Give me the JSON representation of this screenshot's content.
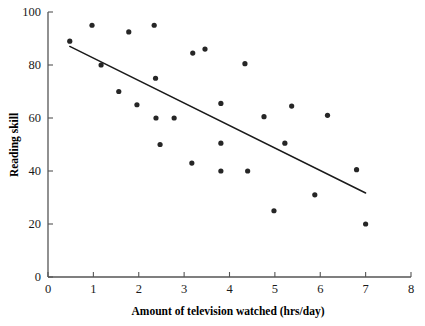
{
  "chart_data": {
    "type": "scatter",
    "title": "",
    "xlabel": "Amount of television watched (hrs/day)",
    "ylabel": "Reading skill",
    "xlim": [
      0,
      8
    ],
    "ylim": [
      0,
      100
    ],
    "xticks": [
      0,
      1,
      2,
      3,
      4,
      5,
      6,
      7,
      8
    ],
    "yticks": [
      0,
      20,
      40,
      60,
      80,
      100
    ],
    "xtick_labels": [
      "0",
      "1",
      "2",
      "3",
      "4",
      "5",
      "6",
      "7",
      "8"
    ],
    "ytick_labels": [
      "0",
      "20",
      "40",
      "60",
      "80",
      "100"
    ],
    "grid": false,
    "legend": null,
    "point_color": "#262626",
    "line_color": "#1a1a1a",
    "points": [
      {
        "x": 0.48,
        "y": 89
      },
      {
        "x": 0.97,
        "y": 95
      },
      {
        "x": 1.17,
        "y": 80
      },
      {
        "x": 1.56,
        "y": 70
      },
      {
        "x": 1.78,
        "y": 92.5
      },
      {
        "x": 1.96,
        "y": 65
      },
      {
        "x": 2.34,
        "y": 95
      },
      {
        "x": 2.37,
        "y": 75
      },
      {
        "x": 2.38,
        "y": 60
      },
      {
        "x": 2.47,
        "y": 50
      },
      {
        "x": 2.78,
        "y": 60
      },
      {
        "x": 3.17,
        "y": 43
      },
      {
        "x": 3.19,
        "y": 84.5
      },
      {
        "x": 3.46,
        "y": 86
      },
      {
        "x": 3.81,
        "y": 65.5
      },
      {
        "x": 3.81,
        "y": 50.5
      },
      {
        "x": 3.81,
        "y": 40
      },
      {
        "x": 4.34,
        "y": 80.5
      },
      {
        "x": 4.4,
        "y": 40
      },
      {
        "x": 4.76,
        "y": 60.5
      },
      {
        "x": 4.98,
        "y": 25
      },
      {
        "x": 5.22,
        "y": 50.5
      },
      {
        "x": 5.37,
        "y": 64.5
      },
      {
        "x": 5.88,
        "y": 31
      },
      {
        "x": 6.16,
        "y": 61
      },
      {
        "x": 6.8,
        "y": 40.5
      },
      {
        "x": 7.0,
        "y": 20
      }
    ],
    "trend_line": {
      "label": "regression-line",
      "x1": 0.48,
      "y1": 87,
      "x2": 7.0,
      "y2": 31.7
    }
  }
}
